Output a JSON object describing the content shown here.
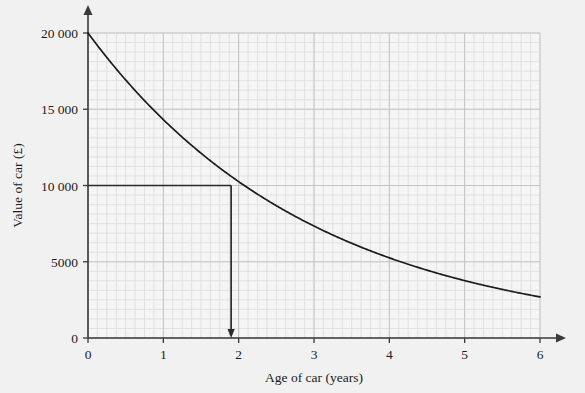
{
  "chart_data": {
    "type": "line",
    "title": "",
    "xlabel": "Age of car (years)",
    "ylabel": "Value of car (£)",
    "xlim": [
      0,
      6
    ],
    "ylim": [
      0,
      20000
    ],
    "grid": true,
    "grid_major_x": 1,
    "grid_major_y": 5000,
    "grid_minor_x": 0.125,
    "grid_minor_y": 625,
    "legend": "none",
    "xticks": [
      0,
      1,
      2,
      3,
      4,
      5,
      6
    ],
    "xtick_labels": [
      "0",
      "1",
      "2",
      "3",
      "4",
      "5",
      "6"
    ],
    "yticks": [
      0,
      5000,
      10000,
      15000,
      20000
    ],
    "ytick_labels": [
      "0",
      "5000",
      "10 000",
      "15 000",
      "20 000"
    ],
    "series": [
      {
        "name": "Value of car",
        "curve": "exponential decay",
        "initial_value": 20000,
        "decay_factor_per_year": 0.716,
        "x": [
          0,
          0.25,
          0.5,
          0.75,
          1,
          1.25,
          1.5,
          1.75,
          1.9,
          2,
          2.25,
          2.5,
          2.75,
          3,
          3.25,
          3.5,
          3.75,
          4,
          4.25,
          4.5,
          4.75,
          5,
          5.25,
          5.5,
          5.75,
          6
        ],
        "values": [
          20000,
          18290,
          16920,
          15620,
          14320,
          13100,
          12070,
          11110,
          10000,
          10250,
          9430,
          8680,
          7990,
          7350,
          6770,
          6230,
          5730,
          5280,
          4860,
          4470,
          4110,
          3780,
          3480,
          3200,
          2950,
          2950
        ]
      }
    ],
    "annotations": [
      {
        "type": "construction-line",
        "name": "value-readoff",
        "from_value": 10000,
        "to_age": 1.9,
        "description": "Horizontal line from 10000 on value axis to curve, then vertical arrow down to age axis at approximately 1.9 years"
      }
    ],
    "colors": {
      "background": "#f1f1f1",
      "plot_background": "#f5f5f5",
      "grid_minor": "#dcdcdc",
      "grid_major": "#c4c4c4",
      "axis": "#3a3a3a",
      "curve": "#1c1c1c",
      "annotation": "#2b2b2b"
    }
  }
}
